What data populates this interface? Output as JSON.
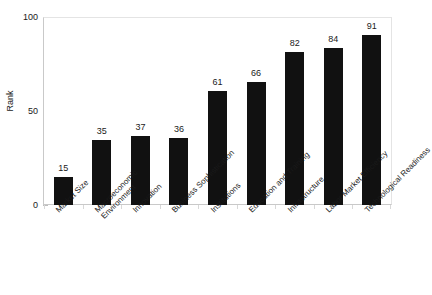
{
  "chart_data": {
    "type": "bar",
    "title": "",
    "xlabel": "",
    "ylabel": "Rank",
    "ylim": [
      0,
      100
    ],
    "yticks": [
      0,
      50,
      100
    ],
    "grid": false,
    "legend": null,
    "orientation": "vertical",
    "bar_color": "#111111",
    "background_color": "#ffffff",
    "axis_color": "#c9c9c9",
    "text_color": "#1a1a1a",
    "categories": [
      "Market Size",
      "Macroeconomic\nEnvironment",
      "Innovation",
      "Business Sophistication",
      "Institutions",
      "Education and Training",
      "Infrastructure",
      "Labor Market Efficiency",
      "Technological Readiness"
    ],
    "values": [
      15,
      35,
      37,
      36,
      61,
      66,
      82,
      84,
      91
    ],
    "data_labels": [
      "15",
      "35",
      "37",
      "36",
      "61",
      "66",
      "82",
      "84",
      "91"
    ]
  },
  "axes": {
    "y_title": "Rank",
    "y_tick_labels": [
      "100",
      "50",
      "0"
    ]
  },
  "bars": [
    {
      "label": "Market Size",
      "value": 15,
      "value_text": "15"
    },
    {
      "label": "Macroeconomic\nEnvironment",
      "value": 35,
      "value_text": "35"
    },
    {
      "label": "Innovation",
      "value": 37,
      "value_text": "37"
    },
    {
      "label": "Business Sophistication",
      "value": 36,
      "value_text": "36"
    },
    {
      "label": "Institutions",
      "value": 61,
      "value_text": "61"
    },
    {
      "label": "Education and Training",
      "value": 66,
      "value_text": "66"
    },
    {
      "label": "Infrastructure",
      "value": 82,
      "value_text": "82"
    },
    {
      "label": "Labor Market Efficiency",
      "value": 84,
      "value_text": "84"
    },
    {
      "label": "Technological Readiness",
      "value": 91,
      "value_text": "91"
    }
  ]
}
